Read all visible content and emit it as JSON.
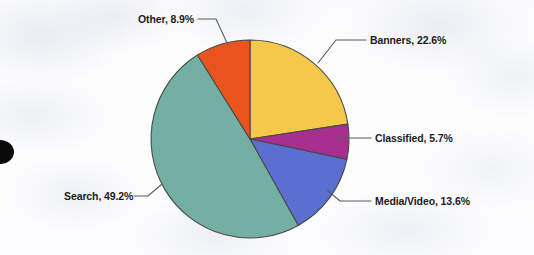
{
  "chart_data": {
    "type": "pie",
    "title": "",
    "subtitle": "",
    "xlabel": "",
    "ylabel": "",
    "legend_position": "none",
    "grid": false,
    "labels_format": "{name}, {value}%",
    "start_angle_deg": 0,
    "direction": "clockwise",
    "categories": [
      "Banners",
      "Classified",
      "Media/Video",
      "Search",
      "Other"
    ],
    "values": [
      22.6,
      5.7,
      13.6,
      49.2,
      8.9
    ],
    "colors": [
      "#F5C84A",
      "#A82F90",
      "#5A6FD0",
      "#73AFA2",
      "#E8541C"
    ],
    "slices": [
      {
        "name": "Banners",
        "value": 22.6,
        "color": "#F5C84A",
        "label": "Banners, 22.6%",
        "label_x": 370,
        "label_y": 36
      },
      {
        "name": "Classified",
        "value": 5.7,
        "color": "#A82F90",
        "label": "Classified, 5.7%",
        "label_x": 375,
        "label_y": 133
      },
      {
        "name": "Media/Video",
        "value": 13.6,
        "color": "#5A6FD0",
        "label": "Media/Video, 13.6%",
        "label_x": 375,
        "label_y": 196
      },
      {
        "name": "Search",
        "value": 49.2,
        "color": "#73AFA2",
        "label": "Search, 49.2%",
        "label_x": 64,
        "label_y": 192
      },
      {
        "name": "Other",
        "value": 8.9,
        "color": "#E8541C",
        "label": "Other, 8.9%",
        "label_x": 138,
        "label_y": 14
      }
    ],
    "total": 100.0
  },
  "figure": {
    "background_color": "#fdfdfe",
    "outline_color": "#4a4a4a",
    "label_color": "#1c1c1c",
    "artifact_name": "hole-punch-mark"
  }
}
